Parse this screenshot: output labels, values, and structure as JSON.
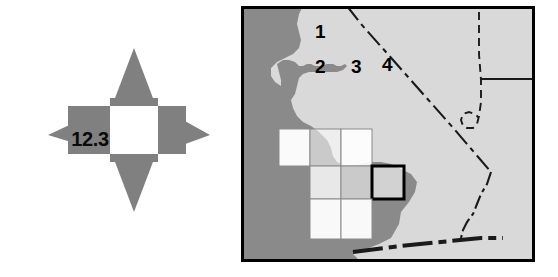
{
  "figure": {
    "background_color": "#ffffff",
    "width": 558,
    "height": 277
  },
  "north_arrow": {
    "name": "four-point-compass-arrow",
    "value_label": "12.3",
    "fill_color": "#808080",
    "center_color": "#ffffff",
    "text_color": "#0a0a0a",
    "points": 4
  },
  "map": {
    "region": "California and Nevada",
    "frame_color": "#000000",
    "land_color": "#d9d9d9",
    "water_color": "#8a8a8a",
    "border_line_color": "#1a1a1a",
    "grid": {
      "cell_fill": "#ffffff",
      "cell_stroke": "#8a8a8a",
      "highlight_stroke": "#000000",
      "cells": [
        {
          "label": "1",
          "highlighted": false
        },
        {
          "label": "2",
          "highlighted": false
        },
        {
          "label": "3",
          "highlighted": false
        },
        {
          "label": "4",
          "highlighted": true
        }
      ]
    }
  }
}
